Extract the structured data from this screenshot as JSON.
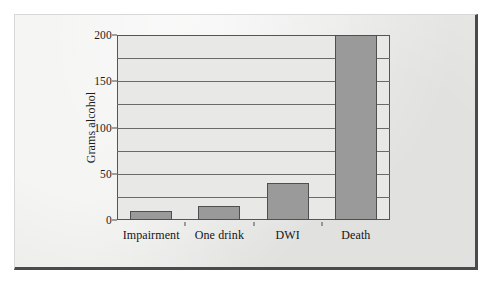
{
  "figure": {
    "frame_color": "#4a4a4a",
    "page_color": "#e9e9e7",
    "plot_background": "#e8e8e6"
  },
  "chart_data": {
    "type": "bar",
    "title": "",
    "subtitle": "",
    "xlabel": "",
    "ylabel": "Grams alcohol",
    "categories": [
      "Impairment",
      "One drink",
      "DWI",
      "Death"
    ],
    "values": [
      10,
      15,
      40,
      200
    ],
    "series": [
      {
        "name": "Grams alcohol",
        "values": [
          10,
          15,
          40,
          200
        ]
      }
    ],
    "ylim": [
      0,
      200
    ],
    "xlim_note": "categorical",
    "y_major_ticks": [
      0,
      50,
      100,
      150,
      200
    ],
    "y_major_tick_labels": [
      "0",
      "50",
      "100",
      "150",
      "200"
    ],
    "y_minor_gridlines": [
      25,
      75,
      125,
      175
    ],
    "y_all_gridlines": [
      25,
      50,
      75,
      100,
      125,
      150,
      175
    ],
    "grid": "horizontal",
    "legend": "none",
    "legend_position": "none",
    "bar_fill_color": "#9a9a9a",
    "bar_edge_color": "#4f4f4f",
    "gridline_color": "#6a6a6a",
    "axis_color": "#555555",
    "text_color": "#1c1c1c",
    "annotations": []
  }
}
